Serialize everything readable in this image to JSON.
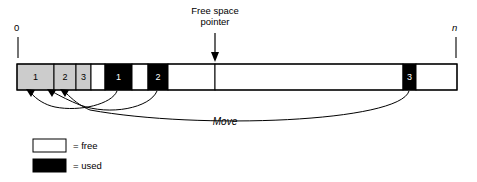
{
  "figure": {
    "type": "memory-compaction-diagram",
    "colors": {
      "free_fill": "#ffffff",
      "used_fill": "#000000",
      "moved_fill": "#cccccc",
      "outline": "#000000",
      "text": "#000000",
      "text_on_used": "#ffffff"
    }
  },
  "axis": {
    "start_label": "0",
    "end_label": "n",
    "start_label_italic": false,
    "end_label_italic": true
  },
  "pointer": {
    "label_line1": "Free space",
    "label_line2": "pointer",
    "arrow": "down-arrow-icon",
    "target_x": 215
  },
  "memory_bar": {
    "x": 17,
    "y": 64,
    "width": 440,
    "height": 26,
    "blocks": [
      {
        "id": "compacted-1",
        "label": "1",
        "state": "moved",
        "x": 17,
        "width": 37
      },
      {
        "id": "compacted-2",
        "label": "2",
        "state": "moved",
        "x": 54,
        "width": 22
      },
      {
        "id": "compacted-3",
        "label": "3",
        "state": "moved",
        "x": 76,
        "width": 15
      },
      {
        "id": "gap-1",
        "label": "",
        "state": "free",
        "x": 91,
        "width": 14
      },
      {
        "id": "used-1",
        "label": "1",
        "state": "used",
        "x": 105,
        "width": 27
      },
      {
        "id": "gap-2",
        "label": "",
        "state": "free",
        "x": 132,
        "width": 16
      },
      {
        "id": "used-2",
        "label": "2",
        "state": "used",
        "x": 148,
        "width": 20
      },
      {
        "id": "gap-3",
        "label": "",
        "state": "free",
        "x": 168,
        "width": 47
      },
      {
        "id": "free-space",
        "label": "",
        "state": "free",
        "x": 215,
        "width": 188
      },
      {
        "id": "used-3",
        "label": "3",
        "state": "used",
        "x": 403,
        "width": 13
      },
      {
        "id": "gap-4",
        "label": "",
        "state": "free",
        "x": 416,
        "width": 41
      }
    ]
  },
  "move_arrows": {
    "label": "Move",
    "label_italic": true,
    "arrows": [
      {
        "id": "move-1",
        "from_block": "used-1",
        "to_block": "compacted-1"
      },
      {
        "id": "move-2",
        "from_block": "used-2",
        "to_block": "compacted-2"
      },
      {
        "id": "move-3",
        "from_block": "used-3",
        "to_block": "compacted-3"
      }
    ]
  },
  "legend": {
    "items": [
      {
        "id": "legend-free",
        "swatch": "free",
        "text": "= free"
      },
      {
        "id": "legend-used",
        "swatch": "used",
        "text": "= used"
      }
    ]
  }
}
